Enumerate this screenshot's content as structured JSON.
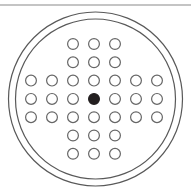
{
  "figure": {
    "canvas": {
      "width": 191,
      "height": 192,
      "background": "#ffffff"
    },
    "colors": {
      "stroke": "#595959",
      "hole_stroke": "#666666",
      "hole_fill": "#ffffff",
      "marked_hole_fill": "#231f20",
      "rule": "#8a8a8a"
    },
    "top_rule": {
      "x1": 0,
      "y1": 5,
      "x2": 191,
      "y2": 5,
      "stroke_width": 1.1
    },
    "outer_circle": {
      "cx": 95.5,
      "cy": 99,
      "r": 87,
      "stroke_width": 1.2,
      "fill": "none"
    },
    "inner_circle": {
      "cx": 95.5,
      "cy": 99,
      "r": 80,
      "stroke_width": 1.2,
      "fill": "none"
    },
    "hole_grid": {
      "origin_x": 31,
      "origin_y": 44,
      "col_spacing": 21,
      "row_spacing": 18.3,
      "hole_radius": 5.4,
      "hole_stroke_width": 1.2,
      "rows": 7,
      "cols": 7,
      "counts_per_row": [
        3,
        3,
        7,
        7,
        7,
        3,
        3
      ],
      "marked_hole": {
        "row": 3,
        "col": 3
      },
      "layout": [
        [
          0,
          0,
          1,
          1,
          1,
          0,
          0
        ],
        [
          0,
          0,
          1,
          1,
          1,
          0,
          0
        ],
        [
          1,
          1,
          1,
          1,
          1,
          1,
          1
        ],
        [
          1,
          1,
          1,
          2,
          1,
          1,
          1
        ],
        [
          1,
          1,
          1,
          1,
          1,
          1,
          1
        ],
        [
          0,
          0,
          1,
          1,
          1,
          0,
          0
        ],
        [
          0,
          0,
          1,
          1,
          1,
          0,
          0
        ]
      ],
      "total_holes": 37
    }
  }
}
